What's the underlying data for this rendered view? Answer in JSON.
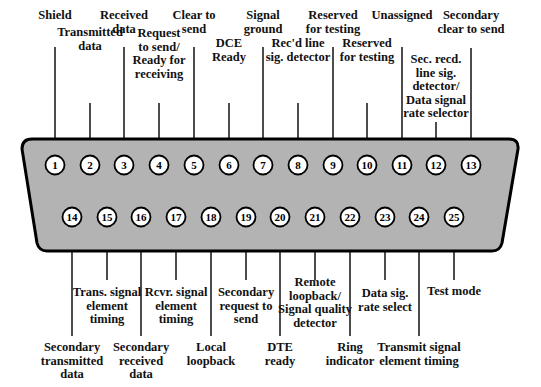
{
  "diagram": {
    "colors": {
      "shell_fill": "#b3b3b3",
      "shell_stroke": "#000000",
      "pin_fill": "#ffffff",
      "text": "#111111"
    }
  },
  "pins": [
    {
      "n": "1",
      "label": "Shield"
    },
    {
      "n": "2",
      "label": "Transmitted\ndata"
    },
    {
      "n": "3",
      "label": "Received\ndata"
    },
    {
      "n": "4",
      "label": "Request\nto send/\nReady for\nreceiving"
    },
    {
      "n": "5",
      "label": "Clear to\nsend"
    },
    {
      "n": "6",
      "label": "DCE\nReady"
    },
    {
      "n": "7",
      "label": "Signal\nground"
    },
    {
      "n": "8",
      "label": "Rec'd line\nsig. detector"
    },
    {
      "n": "9",
      "label": "Reserved\nfor testing"
    },
    {
      "n": "10",
      "label": "Reserved\nfor testing"
    },
    {
      "n": "11",
      "label": "Unassigned"
    },
    {
      "n": "12",
      "label": "Sec. recd.\nline sig.\ndetector/\nData signal\nrate selector"
    },
    {
      "n": "13",
      "label": "Secondary\nclear to send"
    },
    {
      "n": "14",
      "label": "Secondary\ntransmitted\ndata"
    },
    {
      "n": "15",
      "label": "Trans. signal\nelement\ntiming"
    },
    {
      "n": "16",
      "label": "Secondary\nreceived\ndata"
    },
    {
      "n": "17",
      "label": "Rcvr. signal\nelement\ntiming"
    },
    {
      "n": "18",
      "label": "Local\nloopback"
    },
    {
      "n": "19",
      "label": "Secondary\nrequest to\nsend"
    },
    {
      "n": "20",
      "label": "DTE\nready"
    },
    {
      "n": "21",
      "label": "Remote\nloopback/\nSignal quality\ndetector"
    },
    {
      "n": "22",
      "label": "Ring\nindicator"
    },
    {
      "n": "23",
      "label": "Data sig.\nrate select"
    },
    {
      "n": "24",
      "label": "Transmit signal\nelement timing"
    },
    {
      "n": "25",
      "label": "Test mode"
    }
  ]
}
